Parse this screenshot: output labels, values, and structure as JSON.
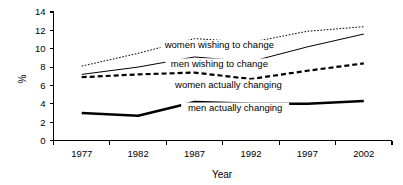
{
  "chart_data": {
    "type": "line",
    "title": "",
    "xlabel": "Year",
    "ylabel": "%",
    "categories": [
      "1977",
      "1982",
      "1987",
      "1992",
      "1997",
      "2002"
    ],
    "x": [
      1977,
      1982,
      1987,
      1992,
      1997,
      2002
    ],
    "xlim": [
      1977,
      2002
    ],
    "ylim": [
      0,
      14
    ],
    "yticks": [
      "0",
      "2",
      "4",
      "6",
      "8",
      "10",
      "12",
      "14"
    ],
    "ytick_values": [
      0,
      2,
      4,
      6,
      8,
      10,
      12,
      14
    ],
    "xticks": [
      "1977",
      "1982",
      "1987",
      "1992",
      "1997",
      "2002"
    ],
    "grid": false,
    "legend": "inline-labels",
    "series": [
      {
        "name": "women wishing to change",
        "style": "dotted",
        "values": [
          8.1,
          9.5,
          11.1,
          10.7,
          11.9,
          12.4
        ]
      },
      {
        "name": "men wishing to change",
        "style": "thin-solid",
        "values": [
          7.2,
          8.0,
          9.1,
          8.6,
          10.2,
          11.6
        ]
      },
      {
        "name": "women actually changing",
        "style": "dashed",
        "values": [
          6.9,
          7.2,
          7.4,
          6.7,
          7.6,
          8.4
        ]
      },
      {
        "name": "men actually changing",
        "style": "thick-solid",
        "values": [
          3.0,
          2.7,
          4.2,
          4.0,
          4.0,
          4.3
        ]
      }
    ],
    "annotations": [
      {
        "text": "women wishing to change",
        "x": 1989.2,
        "y": 10.05
      },
      {
        "text": "men wishing to change",
        "x": 1989.2,
        "y": 8.05
      },
      {
        "text": "women actually changing",
        "x": 1990.0,
        "y": 5.75
      },
      {
        "text": "men actually changing",
        "x": 1990.6,
        "y": 3.25
      }
    ],
    "colors": {
      "line": "#000000",
      "axis": "#000000",
      "background": "#ffffff"
    }
  }
}
